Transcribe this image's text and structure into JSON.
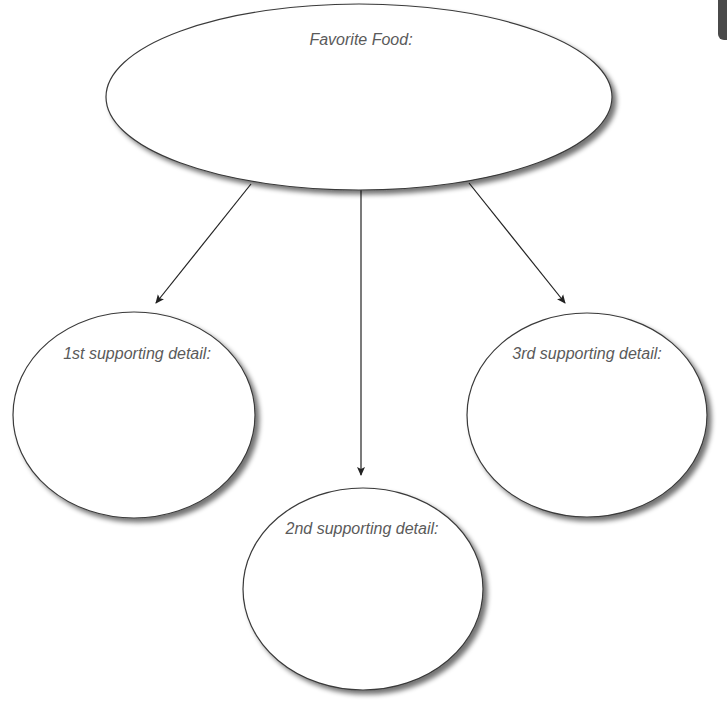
{
  "diagram": {
    "type": "graphic-organizer",
    "main_topic": {
      "label": "Favorite Food:",
      "shape": "ellipse",
      "cx": 359,
      "cy": 97,
      "rx": 253,
      "ry": 93
    },
    "details": [
      {
        "label": "1st supporting detail:",
        "shape": "ellipse",
        "cx": 134,
        "cy": 415,
        "rx": 121,
        "ry": 103
      },
      {
        "label": "2nd supporting detail:",
        "shape": "ellipse",
        "cx": 363,
        "cy": 589,
        "rx": 120,
        "ry": 101
      },
      {
        "label": "3rd supporting detail:",
        "shape": "ellipse",
        "cx": 587,
        "cy": 415,
        "rx": 120,
        "ry": 102
      }
    ],
    "arrows": [
      {
        "from": "main_topic",
        "to": "details.0",
        "x1": 251,
        "y1": 184,
        "x2": 156,
        "y2": 303
      },
      {
        "from": "main_topic",
        "to": "details.1",
        "x1": 361,
        "y1": 190,
        "x2": 361,
        "y2": 475
      },
      {
        "from": "main_topic",
        "to": "details.2",
        "x1": 469,
        "y1": 183,
        "x2": 565,
        "y2": 303
      }
    ],
    "colors": {
      "outline": "#3a3a3a",
      "fill": "#ffffff",
      "text": "#5a5a5a",
      "arrow": "#222222",
      "corner_tab": "#4a4a4a"
    }
  }
}
